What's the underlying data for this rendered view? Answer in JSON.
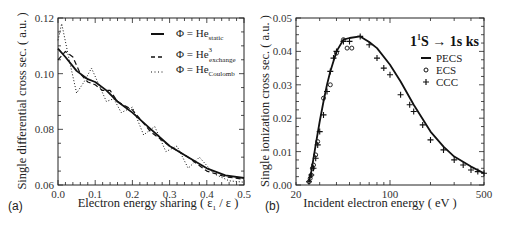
{
  "chart_data": [
    {
      "panel": "(a)",
      "type": "line",
      "title": "",
      "xlabel": "Electron energy sharing ( ε1 / ε )",
      "ylabel": "Single differential cross sec. ( a.u. )",
      "xlim": [
        0.0,
        0.5
      ],
      "ylim": [
        0.06,
        0.12
      ],
      "xticks": [
        "0.0",
        "0.1",
        "0.2",
        "0.3",
        "0.4",
        "0.5"
      ],
      "yticks": [
        "0.06",
        "0.08",
        "0.10",
        "0.12"
      ],
      "grid": false,
      "legend_position": "upper right",
      "series": [
        {
          "name": "Φ = He_static",
          "style": "solid",
          "x": [
            0.0,
            0.02,
            0.05,
            0.08,
            0.1,
            0.13,
            0.16,
            0.2,
            0.25,
            0.3,
            0.35,
            0.4,
            0.45,
            0.5
          ],
          "values": [
            0.109,
            0.106,
            0.101,
            0.098,
            0.097,
            0.094,
            0.09,
            0.086,
            0.08,
            0.074,
            0.07,
            0.066,
            0.0635,
            0.0625
          ]
        },
        {
          "name": "Φ = He³_exchange",
          "style": "dashed",
          "x": [
            0.0,
            0.02,
            0.04,
            0.06,
            0.08,
            0.1,
            0.12,
            0.14,
            0.16,
            0.2,
            0.25,
            0.3,
            0.35,
            0.4,
            0.45,
            0.5
          ],
          "values": [
            0.105,
            0.108,
            0.106,
            0.1,
            0.097,
            0.096,
            0.094,
            0.094,
            0.09,
            0.087,
            0.079,
            0.074,
            0.07,
            0.065,
            0.063,
            0.062
          ]
        },
        {
          "name": "Φ = He_Coulomb",
          "style": "dotted",
          "x": [
            0.0,
            0.01,
            0.03,
            0.05,
            0.07,
            0.09,
            0.11,
            0.13,
            0.15,
            0.17,
            0.2,
            0.23,
            0.26,
            0.29,
            0.32,
            0.35,
            0.38,
            0.42,
            0.46,
            0.5
          ],
          "values": [
            0.112,
            0.118,
            0.105,
            0.093,
            0.097,
            0.102,
            0.096,
            0.09,
            0.091,
            0.086,
            0.088,
            0.078,
            0.081,
            0.072,
            0.074,
            0.066,
            0.07,
            0.064,
            0.0615,
            0.061
          ]
        }
      ]
    },
    {
      "panel": "(b)",
      "type": "line",
      "title": "1¹S → 1s ks",
      "xlabel": "Incident electron energy ( eV )",
      "ylabel": "Single ionization cross sec. ( a.u. )",
      "xscale": "log",
      "xlim": [
        20,
        500
      ],
      "ylim": [
        0.0,
        0.05
      ],
      "xticks": [
        "20",
        "100",
        "500"
      ],
      "yticks": [
        "0.00",
        "0.01",
        "0.02",
        "0.03",
        "0.04",
        "0.05"
      ],
      "grid": false,
      "legend_position": "upper right",
      "series": [
        {
          "name": "PECS",
          "style": "solid-line",
          "x": [
            25,
            26,
            27,
            28,
            30,
            32,
            34,
            36,
            40,
            45,
            50,
            60,
            70,
            80,
            100,
            120,
            150,
            200,
            250,
            300,
            400,
            500
          ],
          "values": [
            0.001,
            0.004,
            0.008,
            0.012,
            0.019,
            0.025,
            0.03,
            0.034,
            0.04,
            0.0435,
            0.044,
            0.0445,
            0.0428,
            0.041,
            0.036,
            0.031,
            0.024,
            0.016,
            0.0115,
            0.0085,
            0.0055,
            0.0035
          ]
        },
        {
          "name": "ECS",
          "style": "open-circle",
          "x": [
            25,
            25.5,
            26,
            26.5,
            27,
            28,
            29,
            32,
            36,
            40,
            45,
            48,
            52
          ],
          "values": [
            0.001,
            0.002,
            0.003,
            0.005,
            0.006,
            0.009,
            0.013,
            0.026,
            0.03,
            0.0395,
            0.0435,
            0.041,
            0.041
          ]
        },
        {
          "name": "CCC",
          "style": "plus",
          "x": [
            25,
            26,
            27,
            28,
            29,
            30,
            32,
            34,
            36,
            38,
            40,
            45,
            50,
            60,
            70,
            80,
            90,
            100,
            120,
            140,
            150,
            175,
            200,
            250,
            300,
            350,
            400,
            450,
            500
          ],
          "values": [
            0.001,
            0.003,
            0.005,
            0.008,
            0.012,
            0.016,
            0.021,
            0.028,
            0.034,
            0.038,
            0.04,
            0.043,
            0.043,
            0.0445,
            0.042,
            0.038,
            0.035,
            0.033,
            0.027,
            0.024,
            0.022,
            0.018,
            0.0135,
            0.0105,
            0.0075,
            0.006,
            0.0045,
            0.004,
            0.0035
          ]
        }
      ]
    }
  ],
  "panel_a": {
    "label": "(a)",
    "xlabel": "Electron energy sharing ( ε",
    "xlabel_sub": "1",
    "xlabel_tail": " / ε )",
    "ylabel": "Single differential cross sec. ( a.u. )",
    "legend": [
      {
        "prefix": "Φ = He",
        "sup": "",
        "sub": "static"
      },
      {
        "prefix": "Φ = He",
        "sup": "3",
        "sub": "exchange"
      },
      {
        "prefix": "Φ = He",
        "sup": "",
        "sub": "Coulomb"
      }
    ]
  },
  "panel_b": {
    "label": "(b)",
    "xlabel": "Incident electron energy ( eV )",
    "ylabel": "Single ionization cross sec. ( a.u. )",
    "title_main": "1",
    "title_sup": "1",
    "title_rest": "S → 1s ks",
    "legend": [
      "PECS",
      "ECS",
      "CCC"
    ]
  }
}
